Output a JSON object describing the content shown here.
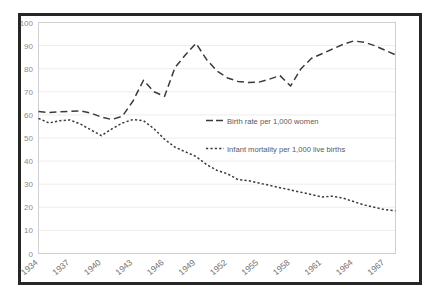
{
  "chart_data": {
    "type": "line",
    "title": "",
    "xlabel": "",
    "ylabel": "",
    "ylim": [
      0,
      100
    ],
    "ytick_step": 10,
    "yticks": [
      0,
      10,
      20,
      30,
      40,
      50,
      60,
      70,
      80,
      90,
      100
    ],
    "grid": true,
    "legend_position": "center",
    "x": [
      1934,
      1935,
      1936,
      1937,
      1938,
      1939,
      1940,
      1941,
      1942,
      1943,
      1944,
      1945,
      1946,
      1947,
      1948,
      1949,
      1950,
      1951,
      1952,
      1953,
      1954,
      1955,
      1956,
      1957,
      1958,
      1959,
      1960,
      1961,
      1962,
      1963,
      1964,
      1965,
      1966,
      1967,
      1968
    ],
    "xtick_labels": [
      "1934",
      "1937",
      "1940",
      "1943",
      "1946",
      "1949",
      "1952",
      "1955",
      "1958",
      "1961",
      "1964",
      "1967"
    ],
    "xtick_values": [
      1934,
      1937,
      1940,
      1943,
      1946,
      1949,
      1952,
      1955,
      1958,
      1961,
      1964,
      1967
    ],
    "series": [
      {
        "name": "Birth rate per 1,000 women",
        "style": "dashed",
        "color": "#3a3a3a",
        "values": [
          61.5,
          61.0,
          61.3,
          61.5,
          61.8,
          60.8,
          59.0,
          58.0,
          59.5,
          66.0,
          75.0,
          70.0,
          68.0,
          80.5,
          86.0,
          91.0,
          84.0,
          79.0,
          76.0,
          74.5,
          74.0,
          74.2,
          75.5,
          77.0,
          72.5,
          80.0,
          84.5,
          86.5,
          88.5,
          90.5,
          92.0,
          91.5,
          90.0,
          88.0,
          86.0
        ]
      },
      {
        "name": "Infant mortality per 1,000 live births",
        "style": "dotted",
        "color": "#3a3a3a",
        "values": [
          58.5,
          56.5,
          57.5,
          57.8,
          56.0,
          53.5,
          51.0,
          54.0,
          56.5,
          58.0,
          57.5,
          54.0,
          49.5,
          46.0,
          44.0,
          42.0,
          38.5,
          36.0,
          34.5,
          32.0,
          31.5,
          30.5,
          29.5,
          28.5,
          27.5,
          26.5,
          25.5,
          24.5,
          24.8,
          24.0,
          22.5,
          21.0,
          20.0,
          19.0,
          18.5
        ]
      }
    ]
  },
  "legend": {
    "items": [
      {
        "label": "Birth rate per 1,000 women",
        "marker": "dashed-line-swatch"
      },
      {
        "label": "Infant mortality per 1,000 live births",
        "marker": "dotted-line-swatch"
      }
    ]
  }
}
